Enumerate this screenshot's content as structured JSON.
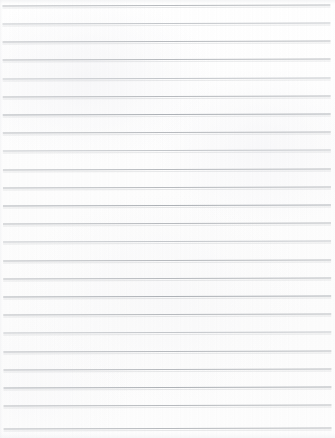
{
  "document": {
    "kind": "blank-lined-paper-scan",
    "title": "",
    "body_text": "",
    "written_content": [],
    "page_width_px": 335,
    "page_height_px": 438,
    "background_color": "#fdfdfd",
    "page_edge_color": "#ffffff"
  },
  "ruling": {
    "style": "horizontal-ruled",
    "line_color": "#b7babe",
    "line_color_light": "#c3c6ca",
    "line_color_dark": "#adb1b6",
    "line_thickness_px": 1,
    "line_spacing_px": 18.2,
    "first_line_y_px": 5,
    "line_count": 24,
    "line_left_x_px": 3,
    "line_right_x_px": 331,
    "line_length_px": 328,
    "tilt_degrees": -0.16,
    "margin_rule": "none",
    "vertical_margin_line": false,
    "header_rule": false,
    "lines": [
      {
        "index": 1,
        "y": 5,
        "ink": "ink-mid"
      },
      {
        "index": 2,
        "y": 23,
        "ink": "ink-soft"
      },
      {
        "index": 3,
        "y": 41,
        "ink": "ink-mid"
      },
      {
        "index": 4,
        "y": 59,
        "ink": "ink-mid"
      },
      {
        "index": 5,
        "y": 78,
        "ink": "ink-soft"
      },
      {
        "index": 6,
        "y": 96,
        "ink": "ink-mid"
      },
      {
        "index": 7,
        "y": 114,
        "ink": "ink-dark"
      },
      {
        "index": 8,
        "y": 132,
        "ink": "ink-mid"
      },
      {
        "index": 9,
        "y": 150,
        "ink": "ink-soft"
      },
      {
        "index": 10,
        "y": 169,
        "ink": "ink-mid"
      },
      {
        "index": 11,
        "y": 187,
        "ink": "ink-mid"
      },
      {
        "index": 12,
        "y": 205,
        "ink": "ink-dark"
      },
      {
        "index": 13,
        "y": 223,
        "ink": "ink-mid"
      },
      {
        "index": 14,
        "y": 241,
        "ink": "ink-soft"
      },
      {
        "index": 15,
        "y": 260,
        "ink": "ink-mid"
      },
      {
        "index": 16,
        "y": 278,
        "ink": "ink-mid"
      },
      {
        "index": 17,
        "y": 296,
        "ink": "ink-dark"
      },
      {
        "index": 18,
        "y": 314,
        "ink": "ink-mid"
      },
      {
        "index": 19,
        "y": 332,
        "ink": "ink-soft"
      },
      {
        "index": 20,
        "y": 351,
        "ink": "ink-mid"
      },
      {
        "index": 21,
        "y": 369,
        "ink": "ink-mid"
      },
      {
        "index": 22,
        "y": 387,
        "ink": "ink-dark"
      },
      {
        "index": 23,
        "y": 405,
        "ink": "ink-mid"
      },
      {
        "index": 24,
        "y": 428,
        "ink": "ink-mid"
      }
    ]
  }
}
